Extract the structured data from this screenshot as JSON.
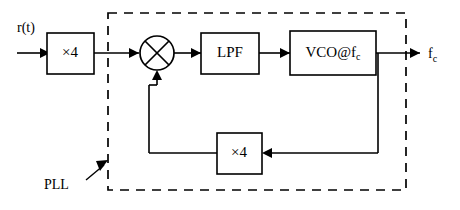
{
  "diagram": {
    "boundary_label": "PLL",
    "blocks": [
      {
        "id": "input-multiplier",
        "label": "×4"
      },
      {
        "id": "mixer",
        "label": "⊗"
      },
      {
        "id": "lpf",
        "label": "LPF"
      },
      {
        "id": "vco",
        "label_main": "VCO@f",
        "label_sub": "c"
      },
      {
        "id": "feedback-multiplier",
        "label": "×4"
      }
    ],
    "signals": {
      "input_label": "r(t)",
      "output_label_main": "f",
      "output_label_sub": "c"
    },
    "colors": {
      "stroke": "#000000",
      "background": "#ffffff"
    }
  }
}
